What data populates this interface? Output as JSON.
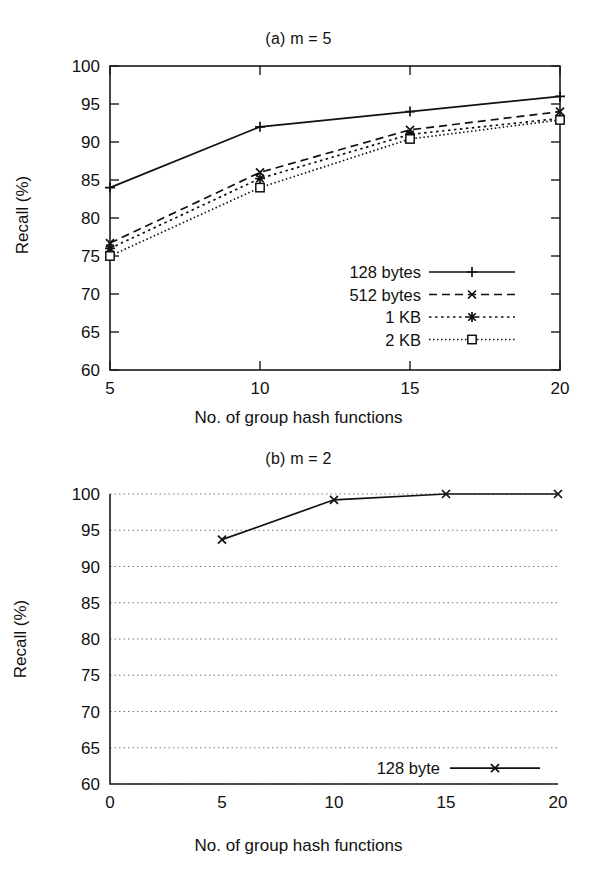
{
  "figure": {
    "panel_a": {
      "title": "(a) m = 5",
      "xlabel": "No. of group hash functions",
      "ylabel": "Recall (%)",
      "xticks": [
        "5",
        "10",
        "15",
        "20"
      ],
      "yticks": [
        "60",
        "65",
        "70",
        "75",
        "80",
        "85",
        "90",
        "95",
        "100"
      ],
      "legend": [
        {
          "label": "128 bytes",
          "style": "solid",
          "marker": "plus"
        },
        {
          "label": "512 bytes",
          "style": "dashed",
          "marker": "cross"
        },
        {
          "label": "1 KB",
          "style": "dotted",
          "marker": "star"
        },
        {
          "label": "2 KB",
          "style": "fine-dotted",
          "marker": "square"
        }
      ]
    },
    "panel_b": {
      "title": "(b) m = 2",
      "xlabel": "No. of group hash functions",
      "ylabel": "Recall (%)",
      "xticks": [
        "0",
        "5",
        "10",
        "15",
        "20"
      ],
      "yticks": [
        "60",
        "65",
        "70",
        "75",
        "80",
        "85",
        "90",
        "95",
        "100"
      ],
      "legend": [
        {
          "label": "128 byte",
          "style": "solid",
          "marker": "cross"
        }
      ]
    }
  },
  "chart_data": [
    {
      "type": "line",
      "title": "(a) m = 5",
      "xlabel": "No. of group hash functions",
      "ylabel": "Recall (%)",
      "x": [
        5,
        10,
        15,
        20
      ],
      "xlim": [
        5,
        20
      ],
      "ylim": [
        60,
        100
      ],
      "ytick_step": 5,
      "grid": false,
      "legend_position": "lower-right",
      "series": [
        {
          "name": "128 bytes",
          "marker": "plus",
          "linestyle": "solid",
          "values": [
            84.0,
            92.0,
            94.0,
            96.0
          ]
        },
        {
          "name": "512 bytes",
          "marker": "cross",
          "linestyle": "dashed",
          "values": [
            76.7,
            86.0,
            91.6,
            94.0
          ]
        },
        {
          "name": "1 KB",
          "marker": "star",
          "linestyle": "dotted",
          "values": [
            76.0,
            85.2,
            91.0,
            93.1
          ]
        },
        {
          "name": "2 KB",
          "marker": "square",
          "linestyle": "fine-dotted",
          "values": [
            75.0,
            84.0,
            90.4,
            92.9
          ]
        }
      ]
    },
    {
      "type": "line",
      "title": "(b) m = 2",
      "xlabel": "No. of group hash functions",
      "ylabel": "Recall (%)",
      "x": [
        5,
        10,
        15,
        20
      ],
      "xlim": [
        0,
        20
      ],
      "ylim": [
        60,
        100
      ],
      "ytick_step": 5,
      "grid": true,
      "legend_position": "lower-right",
      "series": [
        {
          "name": "128 byte",
          "marker": "cross",
          "linestyle": "solid",
          "values": [
            93.7,
            99.2,
            100.0,
            100.0
          ]
        }
      ]
    }
  ]
}
